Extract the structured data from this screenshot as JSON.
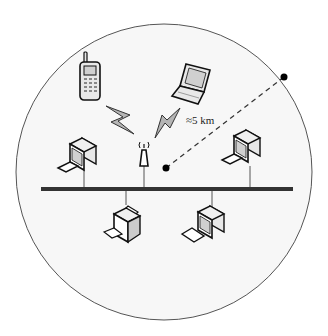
{
  "diagram": {
    "radius_label": "≈5 km",
    "colors": {
      "circle_fill": "#f7f7f7",
      "circle_stroke": "#555555",
      "bus_line": "#333333",
      "device_stroke": "#111111",
      "device_fill": "#e8e8e8",
      "screen_fill": "#d0d0d0",
      "bolt_fill": "#b5b5b5"
    },
    "nodes": [
      {
        "id": "mobile-phone",
        "type": "cell-phone",
        "connection": "wireless"
      },
      {
        "id": "laptop",
        "type": "laptop",
        "connection": "wireless"
      },
      {
        "id": "access-point",
        "type": "antenna",
        "connection": "wired"
      },
      {
        "id": "desktop-left",
        "type": "desktop-computer",
        "connection": "wired"
      },
      {
        "id": "desktop-right",
        "type": "desktop-computer",
        "connection": "wired"
      },
      {
        "id": "printer",
        "type": "printer",
        "connection": "wired"
      },
      {
        "id": "desktop-bottom",
        "type": "desktop-computer",
        "connection": "wired"
      }
    ],
    "links": [
      {
        "from": "mobile-phone",
        "to": "access-point",
        "style": "lightning"
      },
      {
        "from": "laptop",
        "to": "access-point",
        "style": "lightning"
      }
    ]
  }
}
